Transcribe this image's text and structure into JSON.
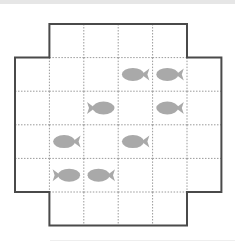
{
  "puzzle": {
    "title": "Fish grid puzzle",
    "grid": {
      "rows": 6,
      "cols": 6,
      "active_cells": [
        [
          0,
          1
        ],
        [
          0,
          2
        ],
        [
          0,
          3
        ],
        [
          0,
          4
        ],
        [
          1,
          0
        ],
        [
          1,
          1
        ],
        [
          1,
          2
        ],
        [
          1,
          3
        ],
        [
          1,
          4
        ],
        [
          1,
          5
        ],
        [
          2,
          0
        ],
        [
          2,
          1
        ],
        [
          2,
          2
        ],
        [
          2,
          3
        ],
        [
          2,
          4
        ],
        [
          2,
          5
        ],
        [
          3,
          0
        ],
        [
          3,
          1
        ],
        [
          3,
          2
        ],
        [
          3,
          3
        ],
        [
          3,
          4
        ],
        [
          3,
          5
        ],
        [
          4,
          0
        ],
        [
          4,
          1
        ],
        [
          4,
          2
        ],
        [
          4,
          3
        ],
        [
          4,
          4
        ],
        [
          4,
          5
        ],
        [
          5,
          1
        ],
        [
          5,
          2
        ],
        [
          5,
          3
        ],
        [
          5,
          4
        ]
      ]
    },
    "fish": [
      {
        "row": 1,
        "col": 3,
        "facing": "left"
      },
      {
        "row": 1,
        "col": 4,
        "facing": "left"
      },
      {
        "row": 2,
        "col": 2,
        "facing": "right"
      },
      {
        "row": 2,
        "col": 4,
        "facing": "left"
      },
      {
        "row": 3,
        "col": 1,
        "facing": "left"
      },
      {
        "row": 3,
        "col": 3,
        "facing": "left"
      },
      {
        "row": 4,
        "col": 1,
        "facing": "right"
      },
      {
        "row": 4,
        "col": 2,
        "facing": "left"
      }
    ],
    "colors": {
      "fish": "#a9a9a9",
      "outline": "#4a4a4a",
      "grid_lines": "#9a9a9a"
    }
  }
}
